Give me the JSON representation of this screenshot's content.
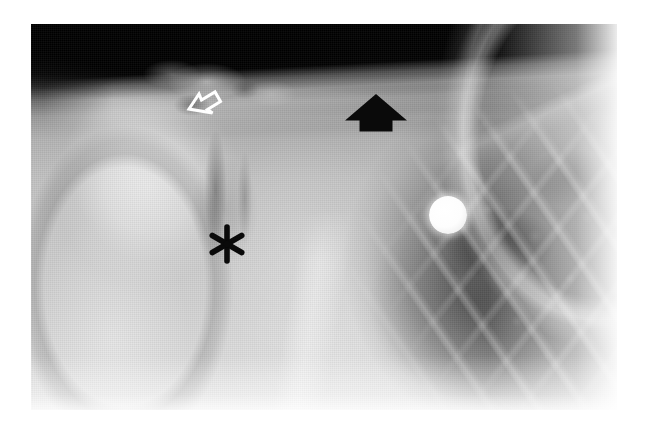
{
  "figure": {
    "modality": "radiograph",
    "view": "shoulder-ap",
    "background_color": "#ffffff",
    "plate": {
      "left": 31,
      "top": 24,
      "width": 586,
      "height": 386,
      "dark_tone": "#0a0a0a",
      "bright_tone": "#e8e8e8"
    }
  },
  "anatomy": [
    {
      "id": "humeral-head",
      "label": "Humeral head"
    },
    {
      "id": "humeral-shaft",
      "label": "Proximal humeral shaft"
    },
    {
      "id": "glenohumeral-joint",
      "label": "Glenohumeral joint space"
    },
    {
      "id": "scapula",
      "label": "Scapula"
    },
    {
      "id": "scapular-border",
      "label": "Lateral scapular border"
    },
    {
      "id": "clavicle",
      "label": "Clavicle"
    },
    {
      "id": "acromion",
      "label": "Acromion"
    },
    {
      "id": "ribs",
      "label": "Ribs"
    },
    {
      "id": "lung-field",
      "label": "Lung field"
    }
  ],
  "markers": [
    {
      "id": "hollow-arrow",
      "glyph": "open-arrow",
      "color": "#ffffff",
      "direction": "up-left",
      "x": 207,
      "y": 105,
      "caption": ""
    },
    {
      "id": "solid-arrow",
      "glyph": "filled-arrow",
      "color": "#000000",
      "direction": "up",
      "x": 376,
      "y": 113,
      "caption": ""
    },
    {
      "id": "asterisk",
      "glyph": "asterisk",
      "color": "#000000",
      "direction": "none",
      "x": 227,
      "y": 244,
      "caption": ""
    },
    {
      "id": "radiopaque-disc",
      "glyph": "filled-circle",
      "color": "#ffffff",
      "direction": "none",
      "x": 417,
      "y": 191,
      "caption": ""
    }
  ]
}
